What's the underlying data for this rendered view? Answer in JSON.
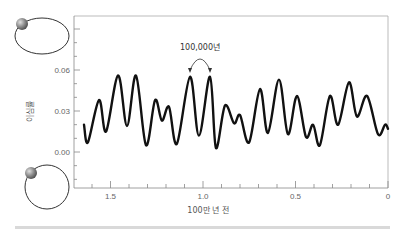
{
  "chart_data": {
    "type": "line",
    "title": "",
    "xlabel": "100만 년 전",
    "ylabel": "이심률",
    "xlim": [
      1.7,
      0
    ],
    "ylim": [
      -0.02,
      0.1
    ],
    "x_ticks": [
      1.5,
      1.0,
      0.5,
      0
    ],
    "x_tick_labels": [
      "1.5",
      "1.0",
      "0.5",
      "0"
    ],
    "y_ticks": [
      0.0,
      0.03,
      0.06
    ],
    "y_tick_labels": [
      "0.00",
      "0.03",
      "0.06"
    ],
    "grid": false,
    "annotation": {
      "text": "100,000년",
      "description": "arrow spanning two adjacent peaks near 1.0 million years ago, indicating ~100,000-year cycle"
    },
    "series": [
      {
        "name": "이심률",
        "x": [
          1.643,
          1.622,
          1.562,
          1.524,
          1.459,
          1.411,
          1.362,
          1.308,
          1.259,
          1.222,
          1.184,
          1.141,
          1.07,
          1.022,
          0.962,
          0.93,
          0.881,
          0.832,
          0.8,
          0.751,
          0.692,
          0.649,
          0.589,
          0.541,
          0.492,
          0.443,
          0.405,
          0.368,
          0.314,
          0.27,
          0.211,
          0.168,
          0.113,
          0.054,
          0.016,
          0.0
        ],
        "values": [
          0.02,
          0.007,
          0.038,
          0.015,
          0.056,
          0.019,
          0.056,
          0.005,
          0.038,
          0.023,
          0.033,
          0.006,
          0.055,
          0.012,
          0.055,
          0.003,
          0.034,
          0.021,
          0.027,
          0.007,
          0.046,
          0.014,
          0.053,
          0.013,
          0.041,
          0.011,
          0.02,
          0.005,
          0.041,
          0.02,
          0.051,
          0.026,
          0.041,
          0.013,
          0.02,
          0.017
        ]
      }
    ],
    "illustrations": [
      {
        "name": "elliptical-orbit",
        "position": "top-left",
        "meaning": "high eccentricity orbit"
      },
      {
        "name": "circular-orbit",
        "position": "bottom-left",
        "meaning": "low eccentricity orbit"
      }
    ]
  },
  "colors": {
    "line": "#111111",
    "axis": "#888888",
    "frame": "#aaaaaa",
    "orbit": "#333333",
    "planet": "#8a8a8a",
    "bottom_bar": "#d9d9d9"
  }
}
